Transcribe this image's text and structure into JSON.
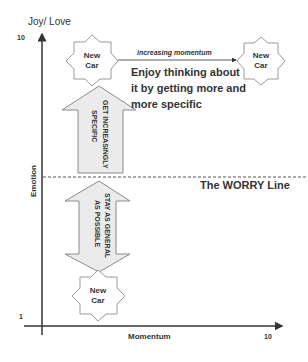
{
  "axes": {
    "y_label_top": "Joy/ Love",
    "y_label_side": "Emotion",
    "y_tick_top": "10",
    "y_tick_bottom": "1",
    "x_label": "Momentum",
    "x_tick_right": "10"
  },
  "stars": {
    "top_left": {
      "line1": "New",
      "line2": "Car"
    },
    "top_right": {
      "line1": "New",
      "line2": "Car"
    },
    "bottom": {
      "line1": "New",
      "line2": "Car"
    }
  },
  "momentum_arrow_label": "increasing momentum",
  "enjoy_text": {
    "line1": "Enjoy thinking about",
    "line2": "it by getting more and",
    "line3": "more specific"
  },
  "up_arrow_text": {
    "line1": "GET INCREASINGLY",
    "line2": "SPECIFIC"
  },
  "double_arrow_text": {
    "line1": "STAY AS GENERAL",
    "line2": "AS POSSIBLE"
  },
  "worry_line_label": "The WORRY Line",
  "colors": {
    "axis": "#333333",
    "arrow_fill": "#ebebeb",
    "arrow_stroke": "#8a8a8a",
    "star_stroke": "#9a9a9a",
    "text": "#333333"
  }
}
